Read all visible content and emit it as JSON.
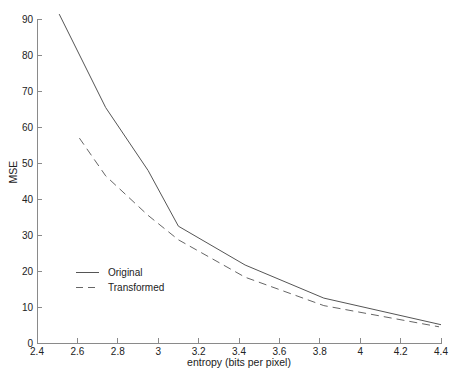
{
  "figure": {
    "width_px": 460,
    "height_px": 382,
    "colors": {
      "background": "#ffffff",
      "solid_line": "#555555",
      "dashed_line": "#666666",
      "axis": "#8a8a8a",
      "text": "#222222"
    }
  },
  "chart_data": {
    "type": "line",
    "title": "",
    "xlabel": "entropy (bits per pixel)",
    "ylabel": "MSE",
    "xlim": [
      2.4,
      4.4
    ],
    "ylim": [
      0,
      90
    ],
    "grid": false,
    "legend_position": "inside lower-left",
    "x_ticks": [
      2.4,
      2.6,
      2.8,
      3,
      3.2,
      3.4,
      3.6,
      3.8,
      4,
      4.2,
      4.4
    ],
    "x_tick_labels": [
      "2.4",
      "2.6",
      "2.8",
      "3",
      "3.2",
      "3.4",
      "3.6",
      "3.8",
      "4",
      "4.2",
      "4.4"
    ],
    "y_ticks": [
      0,
      10,
      20,
      30,
      40,
      50,
      60,
      70,
      80,
      90
    ],
    "y_tick_labels": [
      "0",
      "10",
      "20",
      "30",
      "40",
      "50",
      "60",
      "70",
      "80",
      "90"
    ],
    "series": [
      {
        "name": "Original",
        "style": "solid",
        "points": [
          [
            2.51,
            91.5
          ],
          [
            2.74,
            65.5
          ],
          [
            2.95,
            48.0
          ],
          [
            3.1,
            32.5
          ],
          [
            3.43,
            21.7
          ],
          [
            3.82,
            12.5
          ],
          [
            4.4,
            5.1
          ]
        ]
      },
      {
        "name": "Transformed",
        "style": "dashed",
        "points": [
          [
            2.61,
            57.0
          ],
          [
            2.74,
            46.5
          ],
          [
            2.95,
            35.5
          ],
          [
            3.1,
            28.7
          ],
          [
            3.43,
            18.3
          ],
          [
            3.82,
            10.4
          ],
          [
            4.39,
            4.5
          ]
        ]
      }
    ]
  }
}
